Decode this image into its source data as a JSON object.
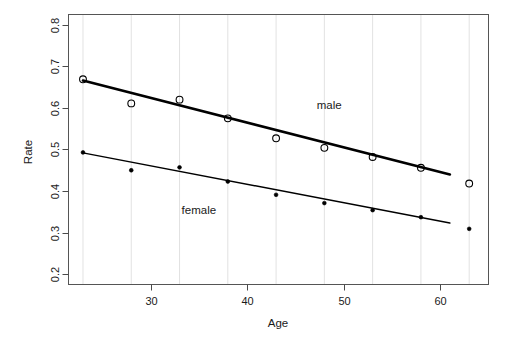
{
  "chart_data": {
    "type": "scatter",
    "title": "",
    "xlabel": "Age",
    "ylabel": "Rate",
    "xlim": [
      21.5,
      65.0
    ],
    "ylim": [
      0.175,
      0.825
    ],
    "xticks": [
      30,
      40,
      50,
      60
    ],
    "yticks": [
      0.2,
      0.3,
      0.4,
      0.5,
      0.6,
      0.7,
      0.8
    ],
    "xtick_labels": [
      "30",
      "40",
      "50",
      "60"
    ],
    "ytick_labels": [
      "0.2",
      "0.3",
      "0.4",
      "0.5",
      "0.6",
      "0.7",
      "0.8"
    ],
    "grid": "vertical-only",
    "legend": "inline-annotations",
    "x": [
      23,
      28,
      33,
      38,
      43,
      48,
      53,
      58,
      63
    ],
    "series": [
      {
        "name": "male",
        "marker": "open-circle",
        "values": [
          0.669,
          0.611,
          0.62,
          0.575,
          0.527,
          0.504,
          0.482,
          0.456,
          0.418
        ],
        "fit_line": {
          "x_start": 23,
          "y_start": 0.666,
          "x_end": 61,
          "y_end": 0.44
        }
      },
      {
        "name": "female",
        "marker": "filled-dot",
        "values": [
          0.493,
          0.45,
          0.457,
          0.423,
          0.391,
          0.371,
          0.354,
          0.337,
          0.309
        ],
        "fit_line": {
          "x_start": 23,
          "y_start": 0.492,
          "x_end": 61,
          "y_end": 0.323
        }
      }
    ],
    "annotations": [
      {
        "text": "male",
        "x": 48.5,
        "y": 0.598
      },
      {
        "text": "female",
        "x": 35.0,
        "y": 0.344
      }
    ]
  },
  "colors": {
    "background": "#ffffff",
    "ink": "#000000",
    "frame": "#555555",
    "grid": "#e2e2e2"
  }
}
